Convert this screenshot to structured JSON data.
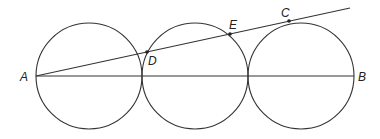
{
  "diagram": {
    "labels": {
      "A": "A",
      "B": "B",
      "C": "C",
      "D": "D",
      "E": "E"
    },
    "circles": [
      "circle-1",
      "circle-2",
      "circle-3"
    ],
    "colors": {
      "stroke": "#333333",
      "background": "#ffffff"
    }
  }
}
